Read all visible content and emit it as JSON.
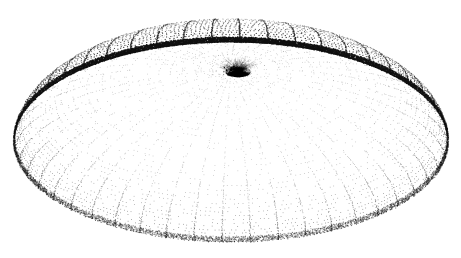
{
  "figure": {
    "title": "Stippled dome surface with polar grid",
    "description": "A dome-shaped (paraboloid / hemispheroid) surface drawn as a stipple plot: radial meridian curves converge on an off-centre apex while concentric parallel rings sweep around it; dot density increases toward the silhouette limb.",
    "render_style": "stipple-dot-grid",
    "background_color": "#ffffff",
    "dot_color": "#2a2a2a",
    "rim_color": "#101010",
    "apex_color": "#000000"
  },
  "canvas": {
    "width": 461,
    "height": 258
  },
  "chart_data": {
    "type": "scatter",
    "title": "Stippled dome surface with polar grid",
    "subtitle": "",
    "xlabel": "",
    "ylabel": "",
    "grid": true,
    "legend_position": "none",
    "projection": {
      "kind": "oblique-orthographic",
      "apex_x": 238,
      "apex_y": 70,
      "center_x": 231,
      "center_y": 142,
      "semi_axis_x": 217,
      "semi_axis_y": 100,
      "dome_height": 128,
      "tilt_degrees": 27,
      "vertical_squash": 0.46
    },
    "extent": {
      "left": 14,
      "right": 448,
      "top": 13,
      "bottom": 241
    },
    "grid_lines": {
      "meridian_count": 48,
      "parallel_count": 34,
      "meridian_label": "meridians",
      "parallel_label": "parallels"
    },
    "sampling": {
      "points_per_meridian": 150,
      "points_per_parallel": 320,
      "dot_radius_min": 0.32,
      "dot_radius_max": 0.95
    },
    "density_profile": {
      "description": "dot opacity and size scale with foreshortening; limb is darkest",
      "interior_alpha": 0.34,
      "limb_alpha": 0.95,
      "apex_alpha": 1.0
    },
    "categories": [
      "apex",
      "upper-slope",
      "mid-slope",
      "lower-slope",
      "limb",
      "base-rim"
    ],
    "values": [
      1.0,
      0.46,
      0.38,
      0.52,
      0.95,
      0.72
    ],
    "ylim": [
      0,
      1
    ]
  },
  "labels": {
    "figure_caption": "",
    "axis_annotations": []
  }
}
